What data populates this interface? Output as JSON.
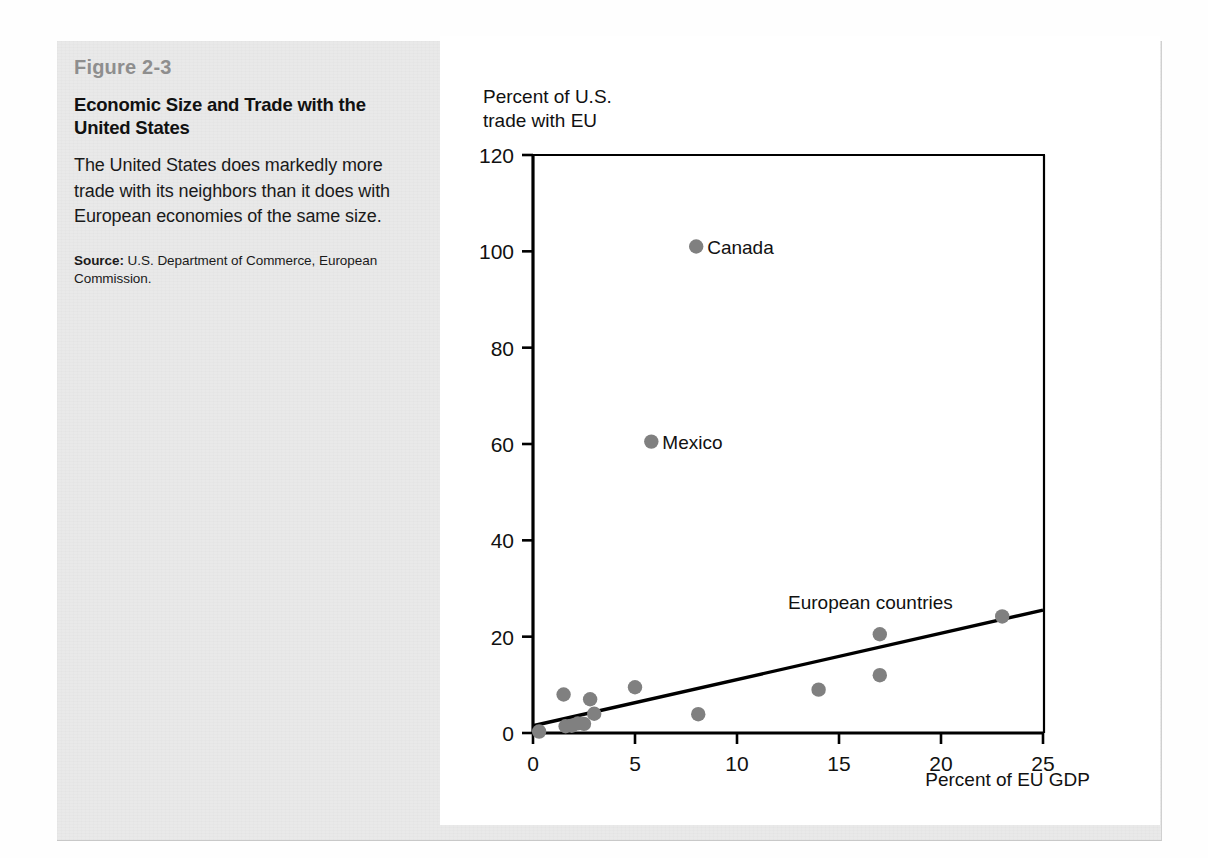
{
  "figure": {
    "number": "Figure 2-3",
    "title": "Economic Size and Trade with the United States",
    "description": "The United States does markedly more trade with its neighbors than it does with European economies of the same size.",
    "source_label": "Source:",
    "source_text": " U.S. Department of Commerce, European Commission."
  },
  "chart_data": {
    "type": "scatter",
    "title": "",
    "xlabel": "Percent of EU GDP",
    "ylabel": "Percent of U.S.\ntrade with EU",
    "xlim": [
      0,
      25
    ],
    "ylim": [
      0,
      120
    ],
    "xticks": [
      0,
      5,
      10,
      15,
      20,
      25
    ],
    "yticks": [
      0,
      20,
      40,
      60,
      80,
      100,
      120
    ],
    "grid": false,
    "legend": "none",
    "point_color": "#808080",
    "line_color": "#000000",
    "series": [
      {
        "name": "European countries",
        "annotation": "European countries",
        "points": [
          {
            "x": 0.3,
            "y": 0.3
          },
          {
            "x": 1.5,
            "y": 8.0
          },
          {
            "x": 1.6,
            "y": 1.4
          },
          {
            "x": 1.9,
            "y": 1.5
          },
          {
            "x": 2.2,
            "y": 2.0
          },
          {
            "x": 2.5,
            "y": 1.9
          },
          {
            "x": 2.8,
            "y": 7.0
          },
          {
            "x": 3.0,
            "y": 4.0
          },
          {
            "x": 5.0,
            "y": 9.5
          },
          {
            "x": 8.1,
            "y": 3.9
          },
          {
            "x": 14.0,
            "y": 9.0
          },
          {
            "x": 17.0,
            "y": 12.0
          },
          {
            "x": 17.0,
            "y": 20.5
          },
          {
            "x": 23.0,
            "y": 24.2
          }
        ]
      },
      {
        "name": "North American neighbors",
        "points": [
          {
            "x": 8.0,
            "y": 101.0,
            "label": "Canada"
          },
          {
            "x": 5.8,
            "y": 60.5,
            "label": "Mexico"
          }
        ]
      }
    ],
    "trendline": {
      "x0": 0,
      "y0": 1.5,
      "x1": 25,
      "y1": 25.5
    }
  }
}
